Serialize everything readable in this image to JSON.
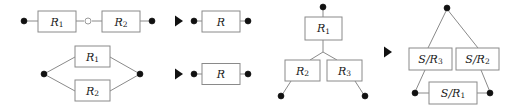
{
  "figure": {
    "width": 506,
    "height": 111,
    "background_color": "#ffffff",
    "line_color": "#8a8a8a",
    "node_color": "#111111",
    "text_color": "#1a1a1a"
  },
  "rules": [
    {
      "id": "series-rule",
      "name": "series reduction",
      "arrow": "→",
      "left": {
        "boxes": [
          {
            "id": "series-r1",
            "label": "R",
            "subscript": "1"
          },
          {
            "id": "series-r2",
            "label": "R",
            "subscript": "2"
          }
        ],
        "nodes": [
          "filled",
          "open",
          "filled"
        ]
      },
      "right": {
        "boxes": [
          {
            "id": "series-result-r",
            "label": "R",
            "subscript": ""
          }
        ],
        "nodes": [
          "filled",
          "filled"
        ]
      }
    },
    {
      "id": "parallel-rule",
      "name": "parallel reduction",
      "arrow": "→",
      "left": {
        "boxes": [
          {
            "id": "parallel-r1",
            "label": "R",
            "subscript": "1"
          },
          {
            "id": "parallel-r2",
            "label": "R",
            "subscript": "2"
          }
        ],
        "nodes": [
          "filled",
          "filled"
        ]
      },
      "right": {
        "boxes": [
          {
            "id": "parallel-result-r",
            "label": "R",
            "subscript": ""
          }
        ],
        "nodes": [
          "filled",
          "filled"
        ]
      }
    },
    {
      "id": "star-delta-rule",
      "name": "star to delta reduction",
      "arrow": "→",
      "left": {
        "boxes": [
          {
            "id": "star-r1",
            "label": "R",
            "subscript": "1"
          },
          {
            "id": "star-r2",
            "label": "R",
            "subscript": "2"
          },
          {
            "id": "star-r3",
            "label": "R",
            "subscript": "3"
          }
        ],
        "nodes": [
          "filled",
          "filled",
          "filled"
        ]
      },
      "right": {
        "boxes": [
          {
            "id": "delta-s-r3",
            "label": "S/R",
            "subscript": "3"
          },
          {
            "id": "delta-s-r2",
            "label": "S/R",
            "subscript": "2"
          },
          {
            "id": "delta-s-r1",
            "label": "S/R",
            "subscript": "1"
          }
        ],
        "nodes": [
          "filled",
          "filled",
          "filled"
        ]
      }
    }
  ]
}
